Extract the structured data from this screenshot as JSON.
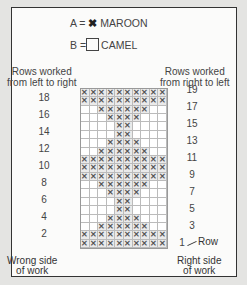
{
  "legend": {
    "a": {
      "prefix": "A =",
      "symbol": "✖",
      "label": "MAROON"
    },
    "b": {
      "prefix": "B =",
      "label": "CAMEL"
    }
  },
  "headers": {
    "left": [
      "Rows worked",
      "from left to right"
    ],
    "right": [
      "Rows worked",
      "from right to left"
    ]
  },
  "row_numbers_left": [
    18,
    16,
    14,
    12,
    10,
    8,
    6,
    4,
    2
  ],
  "row_numbers_right": [
    19,
    17,
    15,
    13,
    11,
    9,
    7,
    5,
    3,
    1
  ],
  "row_label": "Row",
  "footer": {
    "left": [
      "Wrong side",
      "of work"
    ],
    "right": [
      "Right side",
      "of work"
    ]
  },
  "chart_data": {
    "type": "table",
    "columns": 10,
    "rows": 19,
    "legend": {
      "A": "MAROON (x)",
      "B": "CAMEL (blank)"
    },
    "pattern_top_to_bottom": [
      {
        "row": 19,
        "filled_cols": [
          1,
          2,
          3,
          4,
          5,
          6,
          7,
          8,
          9,
          10
        ]
      },
      {
        "row": 18,
        "filled_cols": [
          1,
          2,
          3,
          4,
          5,
          6,
          7,
          8,
          9,
          10
        ]
      },
      {
        "row": 17,
        "filled_cols": [
          3,
          4,
          5,
          6,
          7,
          8
        ]
      },
      {
        "row": 16,
        "filled_cols": [
          4,
          5,
          6,
          7
        ]
      },
      {
        "row": 15,
        "filled_cols": [
          5,
          6
        ]
      },
      {
        "row": 14,
        "filled_cols": [
          5,
          6
        ]
      },
      {
        "row": 13,
        "filled_cols": [
          4,
          5,
          6,
          7
        ]
      },
      {
        "row": 12,
        "filled_cols": [
          3,
          4,
          5,
          6,
          7,
          8
        ]
      },
      {
        "row": 11,
        "filled_cols": [
          1,
          2,
          3,
          4,
          5,
          6,
          7,
          8,
          9,
          10
        ]
      },
      {
        "row": 10,
        "filled_cols": [
          1,
          2,
          3,
          4,
          5,
          6,
          7,
          8,
          9,
          10
        ]
      },
      {
        "row": 9,
        "filled_cols": [
          1,
          2,
          3,
          4,
          5,
          6,
          7,
          8,
          9,
          10
        ]
      },
      {
        "row": 8,
        "filled_cols": [
          3,
          4,
          5,
          6,
          7,
          8
        ]
      },
      {
        "row": 7,
        "filled_cols": [
          4,
          5,
          6,
          7
        ]
      },
      {
        "row": 6,
        "filled_cols": [
          5,
          6
        ]
      },
      {
        "row": 5,
        "filled_cols": [
          5,
          6
        ]
      },
      {
        "row": 4,
        "filled_cols": [
          4,
          5,
          6,
          7
        ]
      },
      {
        "row": 3,
        "filled_cols": [
          3,
          4,
          5,
          6,
          7,
          8
        ]
      },
      {
        "row": 2,
        "filled_cols": [
          1,
          2,
          3,
          4,
          5,
          6,
          7,
          8,
          9,
          10
        ]
      },
      {
        "row": 1,
        "filled_cols": [
          1,
          2,
          3,
          4,
          5,
          6,
          7,
          8,
          9,
          10
        ]
      }
    ]
  }
}
